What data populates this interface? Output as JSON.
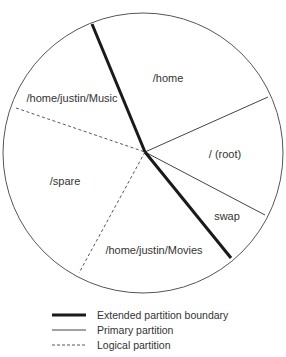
{
  "diagram": {
    "type": "partition-pie",
    "circle": {
      "cx": 143,
      "cy": 153,
      "r": 140,
      "stroke": "#555555"
    },
    "center": {
      "x": 145,
      "y": 152
    },
    "partitions": [
      {
        "label": "/home",
        "x": 143,
        "y": 81
      },
      {
        "label": "/ (root)",
        "x": 228,
        "y": 157
      },
      {
        "label": "swap",
        "x": 237,
        "y": 220
      },
      {
        "label": "/home/justin/Movies",
        "x": 154,
        "y": 253
      },
      {
        "label": "/spare",
        "x": 63,
        "y": 185
      },
      {
        "label": "/home/justin/Music",
        "x": 73,
        "y": 101
      }
    ],
    "boundaries": [
      {
        "kind": "extended",
        "x1": 92,
        "y1": 24,
        "x2": 145,
        "y2": 152
      },
      {
        "kind": "extended",
        "x1": 145,
        "y1": 152,
        "x2": 231,
        "y2": 258
      },
      {
        "kind": "primary",
        "x1": 145,
        "y1": 152,
        "x2": 268,
        "y2": 97
      },
      {
        "kind": "primary",
        "x1": 145,
        "y1": 152,
        "x2": 265,
        "y2": 215
      },
      {
        "kind": "logical",
        "x1": 16,
        "y1": 108,
        "x2": 145,
        "y2": 152
      },
      {
        "kind": "logical",
        "x1": 145,
        "y1": 152,
        "x2": 79,
        "y2": 273
      }
    ]
  },
  "legend": {
    "items": [
      {
        "kind": "extended",
        "label": "Extended partition boundary"
      },
      {
        "kind": "primary",
        "label": "Primary partition"
      },
      {
        "kind": "logical",
        "label": "Logical partition"
      }
    ]
  },
  "colors": {
    "line": "#1a1a1a",
    "thin": "#444444",
    "text": "#333333"
  }
}
